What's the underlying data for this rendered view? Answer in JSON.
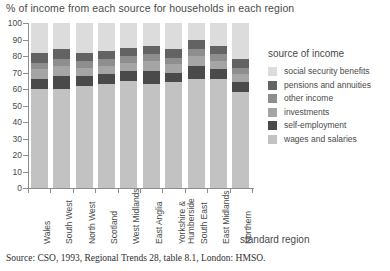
{
  "chart_title": "% of income from each source for households in each region",
  "x_axis_title": "standard region",
  "source_note": "Source: CSO, 1993, Regional Trends 28, table 8.1, London: HMSO.",
  "legend": {
    "title": "source of income",
    "items": [
      {
        "label": "social security benefits",
        "color": "#dcdcdc",
        "swatch_name": "legend-swatch-social-security-benefits"
      },
      {
        "label": "pensions and annuities",
        "color": "#636363",
        "swatch_name": "legend-swatch-pensions-and-annuities"
      },
      {
        "label": "other income",
        "color": "#8e8e8e",
        "swatch_name": "legend-swatch-other-income"
      },
      {
        "label": "investments",
        "color": "#a5a5a5",
        "swatch_name": "legend-swatch-investments"
      },
      {
        "label": "self-employment",
        "color": "#4a4a4a",
        "swatch_name": "legend-swatch-self-employment"
      },
      {
        "label": "wages and salaries",
        "color": "#c2c2c2",
        "swatch_name": "legend-swatch-wages-and-salaries"
      }
    ]
  },
  "y_axis": {
    "label": "",
    "ticks": [
      0,
      10,
      20,
      30,
      40,
      50,
      60,
      70,
      80,
      90,
      100
    ],
    "min": 0,
    "max": 100
  },
  "chart_data": {
    "type": "bar",
    "subtype": "stacked-column-100pct",
    "title": "% of income from each source for households in each region",
    "xlabel": "standard region",
    "ylabel": "",
    "ylim": [
      0,
      100
    ],
    "yticks": [
      0,
      10,
      20,
      30,
      40,
      50,
      60,
      70,
      80,
      90,
      100
    ],
    "grid": false,
    "legend_position": "right",
    "legend_title": "source of income",
    "categories": [
      "Wales",
      "South West",
      "North West",
      "Scotland",
      "West Midlands",
      "East Anglia",
      "Yorkshire & Humberside",
      "South East",
      "East Midlands",
      "Northern"
    ],
    "series": [
      {
        "name": "wages and salaries",
        "color": "#c2c2c2",
        "values": [
          60,
          60,
          62,
          63,
          65,
          63,
          64,
          66,
          66,
          58
        ]
      },
      {
        "name": "self-employment",
        "color": "#4a4a4a",
        "values": [
          6,
          8,
          6,
          6,
          6,
          8,
          6,
          8,
          6,
          6
        ]
      },
      {
        "name": "investments",
        "color": "#a5a5a5",
        "values": [
          6,
          6,
          5,
          5,
          5,
          6,
          5,
          6,
          5,
          5
        ]
      },
      {
        "name": "other income",
        "color": "#8e8e8e",
        "values": [
          4,
          4,
          4,
          4,
          4,
          4,
          4,
          4,
          4,
          4
        ]
      },
      {
        "name": "pensions and annuities",
        "color": "#636363",
        "values": [
          6,
          6,
          5,
          5,
          5,
          5,
          5,
          6,
          5,
          5
        ]
      },
      {
        "name": "social security benefits",
        "color": "#dcdcdc",
        "values": [
          18,
          16,
          18,
          17,
          15,
          14,
          16,
          10,
          14,
          22
        ]
      }
    ]
  }
}
